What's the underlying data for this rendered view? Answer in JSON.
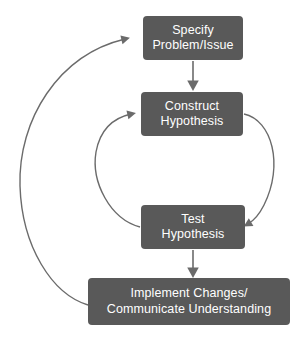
{
  "diagram": {
    "type": "flowchart",
    "colors": {
      "node_fill": "#595959",
      "node_text": "#ffffff",
      "connector": "#6b6b6b",
      "background": "#ffffff"
    },
    "nodes": [
      {
        "id": "specify",
        "lines": [
          "Specify",
          "Problem/Issue"
        ]
      },
      {
        "id": "construct",
        "lines": [
          "Construct",
          "Hypothesis"
        ]
      },
      {
        "id": "test",
        "lines": [
          "Test",
          "Hypothesis"
        ]
      },
      {
        "id": "implement",
        "lines": [
          "Implement Changes/",
          "Communicate Understanding"
        ]
      }
    ],
    "connectors": [
      {
        "id": "specify-to-construct",
        "from": "specify",
        "to": "construct",
        "style": "straight-arrow-down"
      },
      {
        "id": "construct-to-test",
        "from": "construct",
        "to": "test",
        "style": "curved-arrow-right-loop"
      },
      {
        "id": "test-to-construct",
        "from": "test",
        "to": "construct",
        "style": "curved-arrow-left-loop"
      },
      {
        "id": "test-to-implement",
        "from": "test",
        "to": "implement",
        "style": "straight-arrow-down"
      },
      {
        "id": "implement-to-specify",
        "from": "implement",
        "to": "specify",
        "style": "curved-arrow-outer-left-loop"
      }
    ]
  }
}
